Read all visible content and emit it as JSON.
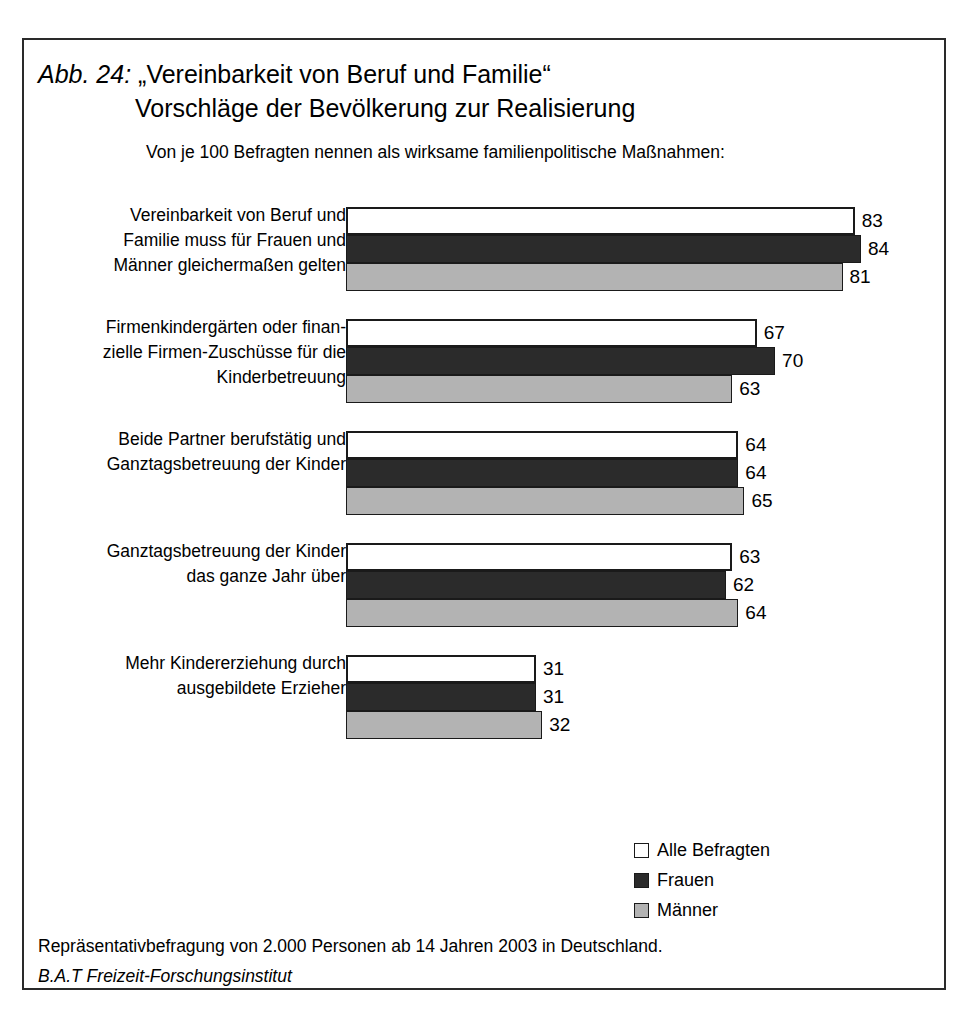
{
  "figure": {
    "number_label": "Abb. 24:",
    "title_line1": "„Vereinbarkeit von Beruf und Familie“",
    "title_line2": "Vorschläge der Bevölkerung zur Realisierung",
    "subtitle": "Von je 100 Befragten nennen als wirksame familienpolitische Maßnahmen:"
  },
  "footer": {
    "line1": "Repräsentativbefragung von 2.000 Personen ab 14 Jahren 2003 in Deutschland.",
    "line2": "B.A.T Freizeit-Forschungsinstitut"
  },
  "legend": {
    "items": [
      {
        "label": "Alle Befragten",
        "color": "#ffffff"
      },
      {
        "label": "Frauen",
        "color": "#2b2b2b"
      },
      {
        "label": "Männer",
        "color": "#b3b3b3"
      }
    ]
  },
  "chart_data": {
    "type": "bar",
    "orientation": "horizontal",
    "subtitle": "Von je 100 Befragten nennen als wirksame familienpolitische Maßnahmen:",
    "xlabel": "",
    "ylabel": "",
    "xlim": [
      0,
      95
    ],
    "grid": false,
    "legend_position": "bottom-right",
    "unit": "von je 100 Befragten",
    "categories": [
      "Vereinbarkeit von Beruf und\nFamilie muss für Frauen und\nMänner gleichermaßen gelten",
      "Firmenkindergärten oder finan-\nzielle Firmen-Zuschüsse für die\nKinderbetreuung",
      "Beide Partner berufstätig und\nGanztagsbetreuung der Kinder",
      "Ganztagsbetreuung der Kinder\ndas ganze Jahr über",
      "Mehr Kindererziehung durch\nausgebildete Erzieher"
    ],
    "series": [
      {
        "name": "Alle Befragten",
        "color": "#ffffff",
        "values": [
          83,
          67,
          64,
          63,
          31
        ]
      },
      {
        "name": "Frauen",
        "color": "#2b2b2b",
        "values": [
          84,
          70,
          64,
          62,
          31
        ]
      },
      {
        "name": "Männer",
        "color": "#b3b3b3",
        "values": [
          81,
          63,
          65,
          64,
          32
        ]
      }
    ]
  }
}
